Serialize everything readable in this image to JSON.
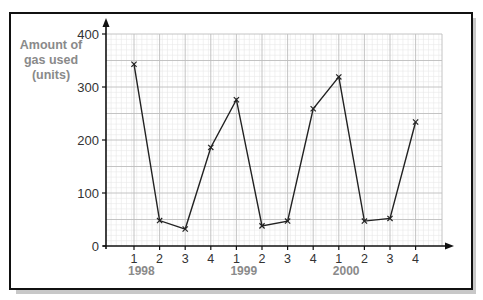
{
  "chart_data": {
    "type": "line",
    "title": "",
    "xlabel": "",
    "ylabel": "Amount of gas used (units)",
    "ylabel_lines": [
      "Amount of",
      "gas used",
      "(units)"
    ],
    "ylim": [
      0,
      400
    ],
    "yticks": [
      0,
      100,
      200,
      300,
      400
    ],
    "grid": true,
    "marker": "x",
    "legend": null,
    "categories": [
      "1998 Q1",
      "1998 Q2",
      "1998 Q3",
      "1998 Q4",
      "1999 Q1",
      "1999 Q2",
      "1999 Q3",
      "1999 Q4",
      "2000 Q1",
      "2000 Q2",
      "2000 Q3",
      "2000 Q4"
    ],
    "quarter_labels": [
      "1",
      "2",
      "3",
      "4",
      "1",
      "2",
      "3",
      "4",
      "1",
      "2",
      "3",
      "4"
    ],
    "year_labels": [
      {
        "label": "1998",
        "at_index": 0
      },
      {
        "label": "1999",
        "at_index": 4
      },
      {
        "label": "2000",
        "at_index": 8
      }
    ],
    "series": [
      {
        "name": "Gas used",
        "values": [
          343,
          48,
          32,
          186,
          276,
          38,
          47,
          259,
          319,
          47,
          52,
          234
        ]
      }
    ]
  },
  "colors": {
    "line": "#222222",
    "major_grid": "#bdbdbd",
    "minor_grid": "#e8e8e8",
    "axis": "#111111",
    "label_gray": "#8a8a8a",
    "tick_text": "#333333"
  }
}
